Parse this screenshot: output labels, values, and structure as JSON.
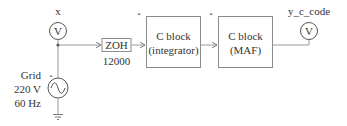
{
  "diagram": {
    "voltmeter_x": {
      "label": "x",
      "symbol": "V"
    },
    "source": {
      "name": "Grid",
      "voltage": "220 V",
      "frequency": "60 Hz",
      "marker": "*"
    },
    "zoh": {
      "label": "ZOH",
      "rate": "12000"
    },
    "block_integrator": {
      "line1": "C block",
      "line2": "(integrator)",
      "marker": "*"
    },
    "block_maf": {
      "line1": "C block",
      "line2": "(MAF)",
      "marker": "*"
    },
    "voltmeter_out": {
      "label": "y_c_code",
      "symbol": "V"
    },
    "colors": {
      "wire": "#9a9a9a",
      "box_border": "#8c8c8c",
      "text": "#333333"
    }
  }
}
